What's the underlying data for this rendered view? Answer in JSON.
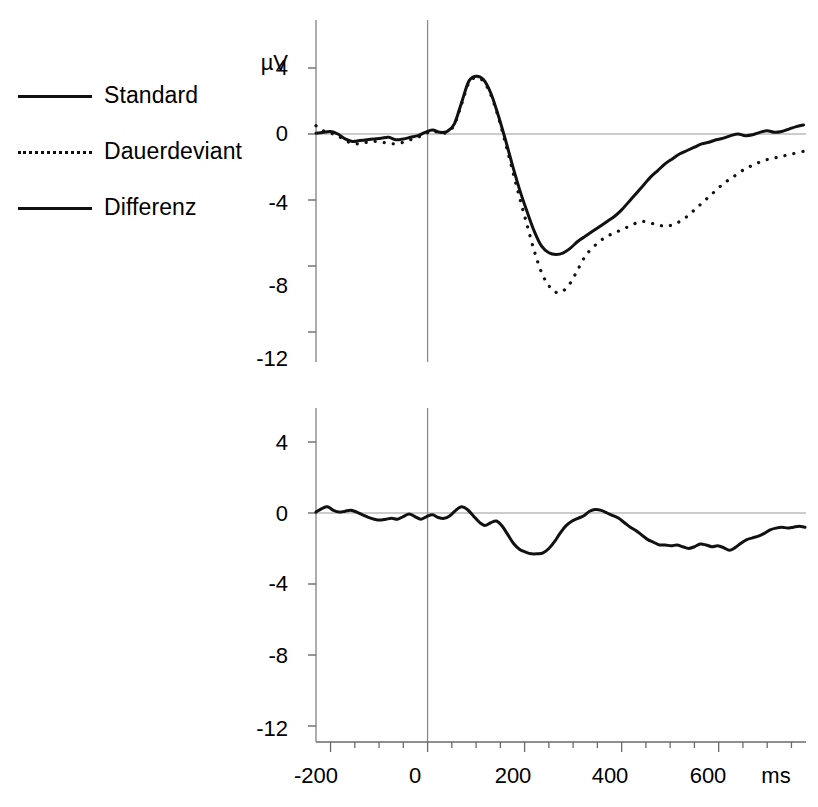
{
  "figure": {
    "title": "",
    "background": "#ffffff",
    "line_color": "#111111"
  },
  "legend": {
    "position": "left",
    "items": [
      {
        "label": "Standard",
        "style": "solid",
        "swatch": "solid-thick"
      },
      {
        "label": "Dauerdeviant",
        "style": "dotted",
        "swatch": "dotted"
      },
      {
        "label": "Differenz",
        "style": "solid",
        "swatch": "solid-thin"
      }
    ]
  },
  "axes": {
    "y_unit": "µV",
    "y_ticks": [
      "4",
      "0",
      "-4",
      "-8",
      "-12"
    ],
    "x_ticks": [
      "-200",
      "0",
      "200",
      "400",
      "600"
    ],
    "x_unit": "ms"
  },
  "chart_data": [
    {
      "type": "line",
      "id": "upper-panel",
      "title": "",
      "xlabel": "ms",
      "ylabel": "µV",
      "xlim": [
        -230,
        780
      ],
      "ylim": [
        -12,
        6
      ],
      "xticks": [
        -200,
        0,
        200,
        400,
        600
      ],
      "yticks": [
        4,
        0,
        -4,
        -8,
        -12
      ],
      "grid": false,
      "zero_line": true,
      "stimulus_onset_line": 0,
      "legend_position": "outside-left",
      "series": [
        {
          "name": "Standard",
          "style": "solid",
          "color": "#111111",
          "x": [
            -230,
            -215,
            -200,
            -185,
            -170,
            -155,
            -140,
            -125,
            -110,
            -95,
            -80,
            -65,
            -50,
            -35,
            -20,
            -5,
            10,
            25,
            40,
            55,
            70,
            85,
            100,
            115,
            130,
            145,
            160,
            175,
            190,
            205,
            220,
            235,
            250,
            265,
            280,
            295,
            310,
            325,
            340,
            355,
            370,
            385,
            400,
            415,
            430,
            445,
            460,
            475,
            490,
            505,
            520,
            535,
            550,
            565,
            580,
            595,
            610,
            625,
            640,
            655,
            670,
            685,
            700,
            715,
            730,
            745,
            760,
            775
          ],
          "y": [
            0.05,
            0.1,
            0.15,
            0.0,
            -0.3,
            -0.45,
            -0.4,
            -0.35,
            -0.3,
            -0.25,
            -0.2,
            -0.35,
            -0.3,
            -0.2,
            -0.1,
            0.1,
            0.25,
            0.1,
            0.15,
            0.6,
            1.9,
            3.2,
            3.5,
            3.3,
            2.5,
            1.2,
            -0.3,
            -1.9,
            -3.4,
            -4.7,
            -5.9,
            -6.8,
            -7.2,
            -7.3,
            -7.2,
            -6.9,
            -6.5,
            -6.2,
            -5.9,
            -5.6,
            -5.3,
            -5.0,
            -4.6,
            -4.1,
            -3.6,
            -3.1,
            -2.6,
            -2.2,
            -1.8,
            -1.5,
            -1.2,
            -1.0,
            -0.8,
            -0.6,
            -0.5,
            -0.35,
            -0.25,
            -0.1,
            0.0,
            -0.1,
            -0.05,
            0.1,
            0.2,
            0.1,
            0.15,
            0.3,
            0.45,
            0.55
          ]
        },
        {
          "name": "Dauerdeviant",
          "style": "dotted",
          "color": "#111111",
          "x": [
            -230,
            -215,
            -200,
            -185,
            -170,
            -155,
            -140,
            -125,
            -110,
            -95,
            -80,
            -65,
            -50,
            -35,
            -20,
            -5,
            10,
            25,
            40,
            55,
            70,
            85,
            100,
            115,
            130,
            145,
            160,
            175,
            190,
            205,
            220,
            235,
            250,
            265,
            280,
            295,
            310,
            325,
            340,
            355,
            370,
            385,
            400,
            415,
            430,
            445,
            460,
            475,
            490,
            505,
            520,
            535,
            550,
            565,
            580,
            595,
            610,
            625,
            640,
            655,
            670,
            685,
            700,
            715,
            730,
            745,
            760,
            775
          ],
          "y": [
            0.5,
            0.2,
            0.05,
            -0.1,
            -0.4,
            -0.55,
            -0.6,
            -0.5,
            -0.45,
            -0.5,
            -0.55,
            -0.6,
            -0.5,
            -0.35,
            -0.2,
            0.0,
            0.2,
            0.05,
            0.1,
            0.55,
            1.8,
            3.1,
            3.4,
            3.2,
            2.4,
            1.1,
            -0.5,
            -2.2,
            -3.9,
            -5.5,
            -7.1,
            -8.4,
            -9.2,
            -9.6,
            -9.5,
            -9.0,
            -8.2,
            -7.4,
            -6.9,
            -6.5,
            -6.2,
            -6.0,
            -5.8,
            -5.6,
            -5.4,
            -5.3,
            -5.4,
            -5.5,
            -5.6,
            -5.5,
            -5.3,
            -5.0,
            -4.6,
            -4.2,
            -3.8,
            -3.4,
            -3.0,
            -2.7,
            -2.4,
            -2.1,
            -1.9,
            -1.7,
            -1.55,
            -1.45,
            -1.35,
            -1.25,
            -1.15,
            -1.05
          ]
        }
      ]
    },
    {
      "type": "line",
      "id": "lower-panel",
      "title": "",
      "xlabel": "ms",
      "ylabel": "",
      "xlim": [
        -230,
        780
      ],
      "ylim": [
        -12,
        6
      ],
      "xticks": [
        -200,
        0,
        200,
        400,
        600
      ],
      "yticks": [
        4,
        0,
        -4,
        -8,
        -12
      ],
      "grid": false,
      "zero_line": true,
      "stimulus_onset_line": 0,
      "series": [
        {
          "name": "Differenz",
          "style": "solid",
          "color": "#111111",
          "x": [
            -230,
            -218,
            -206,
            -194,
            -182,
            -170,
            -158,
            -146,
            -134,
            -122,
            -110,
            -98,
            -86,
            -74,
            -62,
            -50,
            -38,
            -26,
            -14,
            -2,
            10,
            22,
            34,
            46,
            58,
            70,
            82,
            94,
            106,
            118,
            130,
            142,
            154,
            166,
            178,
            190,
            202,
            214,
            226,
            238,
            250,
            262,
            274,
            286,
            298,
            310,
            322,
            334,
            346,
            358,
            370,
            382,
            394,
            406,
            418,
            430,
            442,
            454,
            466,
            478,
            490,
            502,
            514,
            526,
            538,
            550,
            562,
            574,
            586,
            598,
            610,
            622,
            634,
            646,
            658,
            670,
            682,
            694,
            706,
            718,
            730,
            742,
            754,
            766,
            778
          ],
          "y": [
            0.05,
            0.25,
            0.35,
            0.15,
            0.05,
            0.1,
            0.15,
            0.05,
            -0.1,
            -0.25,
            -0.35,
            -0.4,
            -0.35,
            -0.3,
            -0.35,
            -0.2,
            -0.05,
            -0.2,
            -0.35,
            -0.2,
            -0.1,
            -0.25,
            -0.3,
            -0.15,
            0.15,
            0.35,
            0.2,
            -0.15,
            -0.5,
            -0.7,
            -0.55,
            -0.45,
            -0.75,
            -1.25,
            -1.75,
            -2.05,
            -2.2,
            -2.3,
            -2.3,
            -2.25,
            -2.0,
            -1.6,
            -1.1,
            -0.7,
            -0.45,
            -0.3,
            -0.15,
            0.1,
            0.2,
            0.15,
            0.0,
            -0.15,
            -0.3,
            -0.55,
            -0.8,
            -1.0,
            -1.25,
            -1.5,
            -1.65,
            -1.8,
            -1.8,
            -1.85,
            -1.8,
            -1.9,
            -2.0,
            -1.9,
            -1.75,
            -1.8,
            -1.9,
            -1.85,
            -1.95,
            -2.1,
            -1.95,
            -1.7,
            -1.5,
            -1.4,
            -1.3,
            -1.15,
            -0.95,
            -0.85,
            -0.8,
            -0.85,
            -0.8,
            -0.75,
            -0.8
          ]
        }
      ]
    }
  ]
}
